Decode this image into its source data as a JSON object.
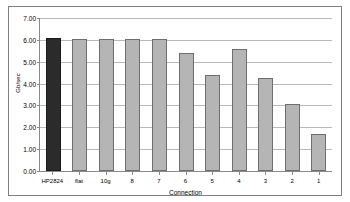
{
  "chart_data": {
    "type": "bar",
    "title": "",
    "xlabel": "Connection",
    "ylabel": "Gb/sec",
    "ylim": [
      0,
      7
    ],
    "ytick_step": 1,
    "ytick_labels": [
      "7.00",
      "6.00",
      "5.00",
      "4.00",
      "3.00",
      "2.00",
      "1.00",
      "0.00"
    ],
    "ytick_values": [
      7,
      6,
      5,
      4,
      3,
      2,
      1,
      0
    ],
    "grid": true,
    "legend": "none",
    "categories": [
      "HP2824",
      "flat",
      "10g",
      "8",
      "7",
      "6",
      "5",
      "4",
      "3",
      "2",
      "1"
    ],
    "values": [
      6.1,
      6.05,
      6.02,
      6.05,
      6.06,
      5.42,
      4.4,
      5.6,
      4.25,
      3.05,
      1.68
    ],
    "series": [
      {
        "name": "Throughput",
        "values": [
          6.1,
          6.05,
          6.02,
          6.05,
          6.06,
          5.42,
          4.4,
          5.6,
          4.25,
          3.05,
          1.68
        ]
      }
    ],
    "bar_colors": [
      "#2b2b2b",
      "#b5b5b5",
      "#b5b5b5",
      "#b5b5b5",
      "#b5b5b5",
      "#b5b5b5",
      "#b5b5b5",
      "#b5b5b5",
      "#b5b5b5",
      "#b5b5b5",
      "#b5b5b5"
    ],
    "colors": {
      "highlight_bar": "#2b2b2b",
      "default_bar": "#b5b5b5",
      "bar_border": "#6e6e6e",
      "gridline": "#b9b9b9",
      "axis": "#8a8a8a",
      "frame": "#808080",
      "background": "#ffffff",
      "text": "#000000"
    }
  }
}
